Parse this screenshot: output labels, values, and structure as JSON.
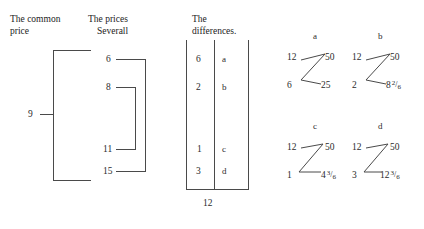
{
  "headers": {
    "common_price_line1": "The common",
    "common_price_line2": "price",
    "prices_severall_line1": "The prices",
    "prices_severall_line2": "Severall",
    "differences_line1": "The",
    "differences_line2": "differences."
  },
  "common_price": {
    "value": "9"
  },
  "prices_severall": {
    "values": [
      "6",
      "8",
      "11",
      "15"
    ]
  },
  "differences": {
    "rows": [
      {
        "value": "6",
        "label": "a"
      },
      {
        "value": "2",
        "label": "b"
      },
      {
        "value": "1",
        "label": "c"
      },
      {
        "value": "3",
        "label": "d"
      }
    ],
    "total": "12"
  },
  "diagrams": [
    {
      "label": "a",
      "top_left": "12",
      "top_right": "50",
      "bottom_left": "6",
      "bottom_right_whole": "25",
      "bottom_right_num": "",
      "bottom_right_den": ""
    },
    {
      "label": "b",
      "top_left": "12",
      "top_right": "50",
      "bottom_left": "2",
      "bottom_right_whole": "8",
      "bottom_right_num": "2",
      "bottom_right_den": "6"
    },
    {
      "label": "c",
      "top_left": "12",
      "top_right": "50",
      "bottom_left": "1",
      "bottom_right_whole": "4",
      "bottom_right_num": "3",
      "bottom_right_den": "6"
    },
    {
      "label": "d",
      "top_left": "12",
      "top_right": "50",
      "bottom_left": "3",
      "bottom_right_whole": "12",
      "bottom_right_num": "3",
      "bottom_right_den": "6"
    }
  ],
  "colors": {
    "ink": "#2b2b2b",
    "rule": "#4a4a4a",
    "paper": "#ffffff"
  }
}
